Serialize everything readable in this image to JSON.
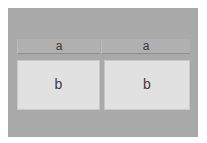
{
  "diagram": {
    "columns": [
      {
        "header": "a",
        "body": "b"
      },
      {
        "header": "a",
        "body": "b"
      }
    ],
    "colors": {
      "background": "#ffffff",
      "panel": "#a9a9a9",
      "header": "#b0b0b0",
      "box": "#e1e1e1",
      "text": "#3a3a3a"
    }
  }
}
